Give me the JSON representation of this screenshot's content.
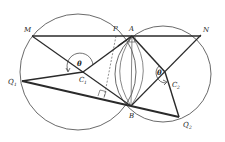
{
  "diagram": {
    "type": "two intersecting circles geometry figure",
    "labels": {
      "M": "M",
      "P": "P",
      "A": "A",
      "N": "N",
      "C1": "C",
      "C1_sub": "1",
      "C2": "C",
      "C2_sub": "2",
      "Q1": "Q",
      "Q1_sub": "1",
      "Q2": "Q",
      "Q2_sub": "2",
      "B": "B",
      "theta_left": "θ",
      "theta_right": "θ"
    },
    "colors": {
      "stroke": "#2a2a2a",
      "thin_stroke": "#555555",
      "background": "#ffffff"
    }
  }
}
